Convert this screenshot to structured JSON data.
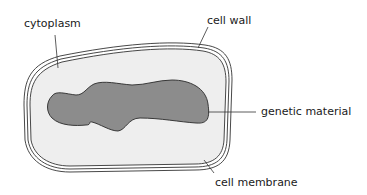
{
  "diagram": {
    "title": "",
    "labels": {
      "cytoplasm": "cytoplasm",
      "cell_wall": "cell wall",
      "genetic_material": "genetic material",
      "cell_membrane": "cell membrane"
    },
    "colors": {
      "background": "#ffffff",
      "cytoplasm_fill": "#eeeeee",
      "genetic_material_fill": "#8c8c8c",
      "outline": "#333333",
      "text": "#1a1a1a"
    }
  }
}
